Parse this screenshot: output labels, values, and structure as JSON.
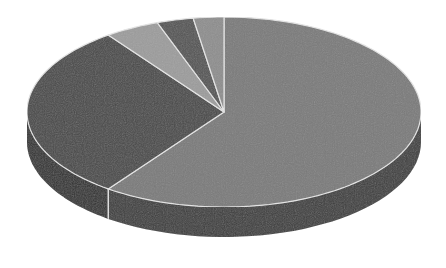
{
  "chart_data": {
    "type": "pie",
    "style": "3d",
    "title": "",
    "categories": [
      "Slice 1",
      "Slice 2",
      "Slice 3",
      "Slice 4",
      "Slice 5"
    ],
    "values": [
      60,
      30,
      4.5,
      3,
      2.5
    ],
    "colors": [
      "#7a7a7a",
      "#4a4a4a",
      "#9c9c9c",
      "#555555",
      "#8e8e8e"
    ],
    "side_colors": [
      "#3e3e3e",
      "#333333",
      "#5a5a5a",
      "#383838",
      "#505050"
    ],
    "start_angle_deg": 0,
    "direction": "clockwise",
    "legend": false,
    "data_labels": false
  },
  "geometry": {
    "cx": 224,
    "cy": 112,
    "rx": 197,
    "ry": 95,
    "depth": 30,
    "separator_color": "#e6e6e6"
  }
}
